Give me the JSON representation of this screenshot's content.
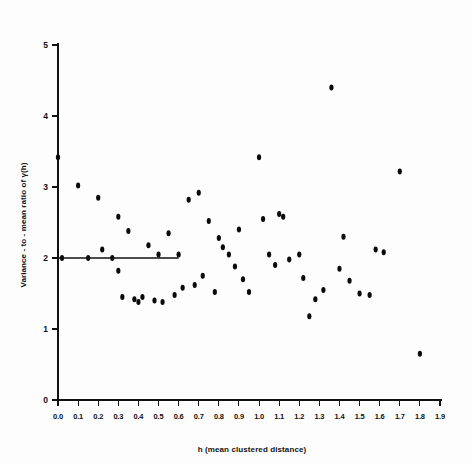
{
  "chart_data": {
    "type": "scatter",
    "title": "",
    "xlabel": "h (mean clustered distance)",
    "ylabel": "Variance - to - mean ratio of γ(h)",
    "xlim": [
      0.0,
      1.9
    ],
    "ylim": [
      0,
      5
    ],
    "xticks": [
      "0.0",
      "0.1",
      "0.2",
      "0.3",
      "0.4",
      "0.5",
      "0.6",
      "0.7",
      "0.8",
      "0.9",
      "1.0",
      "1.1",
      "1.2",
      "1.3",
      "1.4",
      "1.5",
      "1.6",
      "1.7",
      "1.8",
      "1.9"
    ],
    "xtick_values": [
      0.0,
      0.1,
      0.2,
      0.3,
      0.4,
      0.5,
      0.6,
      0.7,
      0.8,
      0.9,
      1.0,
      1.1,
      1.2,
      1.3,
      1.4,
      1.5,
      1.6,
      1.7,
      1.8,
      1.9
    ],
    "yticks": [
      "0",
      "1",
      "2",
      "3",
      "4",
      "5"
    ],
    "ytick_values": [
      0,
      1,
      2,
      3,
      4,
      5
    ],
    "grid": false,
    "legend": null,
    "marker_color": "#0a0a0a",
    "marker_shape": "filled-ellipse",
    "reference_line": {
      "label": "variance-to-mean ratio = 2",
      "y": 2.0,
      "x_start": 0.0,
      "x_end": 0.6,
      "color": "#111111"
    },
    "x": [
      0.0,
      0.02,
      0.1,
      0.15,
      0.2,
      0.22,
      0.27,
      0.3,
      0.3,
      0.32,
      0.35,
      0.38,
      0.4,
      0.42,
      0.45,
      0.48,
      0.5,
      0.52,
      0.55,
      0.58,
      0.6,
      0.62,
      0.65,
      0.68,
      0.7,
      0.72,
      0.75,
      0.78,
      0.8,
      0.82,
      0.85,
      0.88,
      0.9,
      0.92,
      0.95,
      1.0,
      1.02,
      1.05,
      1.08,
      1.1,
      1.12,
      1.15,
      1.2,
      1.22,
      1.25,
      1.28,
      1.32,
      1.36,
      1.4,
      1.42,
      1.45,
      1.5,
      1.55,
      1.58,
      1.62,
      1.7,
      1.8
    ],
    "y": [
      3.42,
      2.0,
      3.02,
      2.0,
      2.85,
      2.12,
      2.0,
      2.58,
      1.82,
      1.45,
      2.38,
      1.42,
      1.38,
      1.45,
      2.18,
      1.4,
      2.05,
      1.38,
      2.35,
      1.48,
      2.05,
      1.58,
      2.82,
      1.62,
      2.92,
      1.75,
      2.52,
      1.52,
      2.28,
      2.15,
      2.05,
      1.88,
      2.4,
      1.7,
      1.52,
      3.42,
      2.55,
      2.05,
      1.9,
      2.62,
      2.58,
      1.98,
      2.05,
      1.72,
      1.18,
      1.42,
      1.55,
      4.4,
      1.85,
      2.3,
      1.68,
      1.5,
      1.48,
      2.12,
      2.08,
      3.22,
      0.65
    ],
    "n_points": 57
  },
  "axis": {
    "x_label": "h (mean clustered distance)",
    "y_label": "Variance - to - mean ratio of γ(h)"
  }
}
